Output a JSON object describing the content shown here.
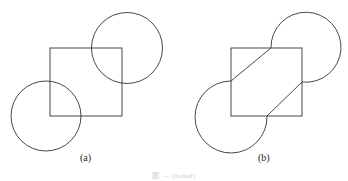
{
  "figure": {
    "panels": [
      {
        "label": "(a)",
        "description": "Square with two circles centered on opposite corners",
        "square": {
          "x": 50,
          "y": 48,
          "w": 72,
          "h": 68
        },
        "circles": [
          {
            "cx": 127,
            "cy": 48,
            "r": 36
          },
          {
            "cx": 46,
            "cy": 116,
            "r": 35
          }
        ]
      },
      {
        "label": "(b)",
        "description": "Resulting outline: square with arcs on opposite corners joined by diagonal tangent lines"
      }
    ],
    "caption": "图 — (faded)"
  },
  "colors": {
    "stroke": "#333333",
    "background": "#ffffff"
  }
}
